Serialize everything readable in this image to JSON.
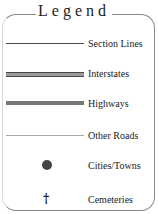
{
  "legend": {
    "title": "Legend",
    "items": [
      {
        "label": "Section Lines",
        "symbol": "thin-line",
        "color": "#4a4a4a"
      },
      {
        "label": "Interstates",
        "symbol": "double-line",
        "color": "#9a9a9a"
      },
      {
        "label": "Highways",
        "symbol": "thick-line",
        "color": "#777777"
      },
      {
        "label": "Other Roads",
        "symbol": "thin-gray-line",
        "color": "#a8a8a8"
      },
      {
        "label": "Cities/Towns",
        "symbol": "filled-circle",
        "color": "#444444"
      },
      {
        "label": "Cemeteries",
        "symbol": "cross-icon",
        "glyph": "†",
        "color": "#111111"
      }
    ]
  }
}
